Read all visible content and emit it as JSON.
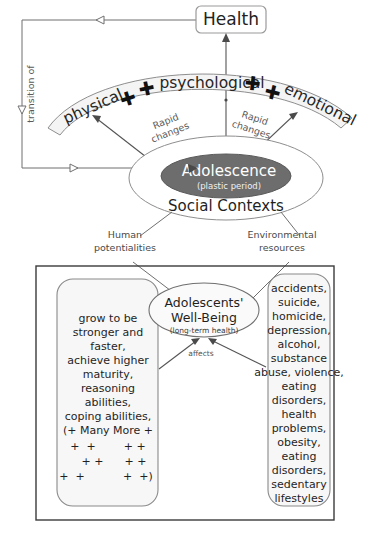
{
  "diagram": {
    "title_node": {
      "label": "Health"
    },
    "arc_band": {
      "segments": [
        {
          "label": "physical",
          "name": "arc-label-physical"
        },
        {
          "label": "psychological",
          "name": "arc-label-psychological"
        },
        {
          "label": "emotional",
          "name": "arc-label-emotional"
        }
      ],
      "plus_glyph": "✚",
      "plus_count": 4
    },
    "feedback_arrow": {
      "label": "transition of"
    },
    "rapid_change_labels": [
      {
        "line1": "Rapid",
        "line2": "changes"
      },
      {
        "line1": "Rapid",
        "line2": "changes"
      }
    ],
    "core": {
      "inner_label": "Adolescence",
      "inner_sublabel": "(plastic period)",
      "outer_label": "Social Contexts",
      "inner_fill": "#6d6d6d",
      "inner_text_color": "#ffffff"
    },
    "input_nodes": [
      {
        "line1": "Human",
        "line2": "potentialities",
        "name": "node-human-potentialities"
      },
      {
        "line1": "Environmental",
        "line2": "resources",
        "name": "node-environmental-resources"
      }
    ],
    "outcome_panel": {
      "center": {
        "line1": "Adolescents'",
        "line2": "Well-Being",
        "sublabel": "(long-term health)",
        "edge_label": "affects"
      },
      "left_box": {
        "lines": [
          "grow to be",
          "stronger and",
          "faster,",
          "achieve higher",
          "maturity,",
          "reasoning",
          "abilities,",
          "coping abilities,",
          "(+ Many More +"
        ],
        "plus_rows": [
          "+  +        + +",
          "+ +      + +",
          "+  +           +  +)"
        ]
      },
      "right_box": {
        "lines": [
          "accidents,",
          "suicide,",
          "homicide,",
          "depression,",
          "alcohol,",
          "substance",
          "abuse, violence,",
          "eating",
          "disorders,",
          "health",
          "problems,",
          "obesity,",
          "eating",
          "disorders,",
          "sedentary",
          "lifestyles"
        ]
      }
    }
  }
}
